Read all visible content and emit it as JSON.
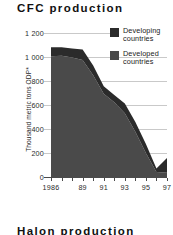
{
  "chart_data": {
    "type": "area",
    "stacked": true,
    "title": "CFC production",
    "xlabel": "",
    "ylabel": "Thousand metric tons ODP*",
    "ylim": [
      0,
      1200
    ],
    "yticks": [
      "0",
      "200",
      "400",
      "600",
      "800",
      "1 000",
      "1 200"
    ],
    "ytick_values": [
      0,
      200,
      400,
      600,
      800,
      1000,
      1200
    ],
    "grid": true,
    "legend_position": "top-right",
    "x": [
      1986,
      1987,
      1988,
      1989,
      1990,
      1991,
      1992,
      1993,
      1994,
      1995,
      1996,
      1997
    ],
    "xtick_labels": [
      "1986",
      "89",
      "91",
      "93",
      "95",
      "97"
    ],
    "xtick_values": [
      1986,
      1989,
      1991,
      1993,
      1995,
      1997
    ],
    "series": [
      {
        "name": "Developed countries",
        "color": "#4a4a4a",
        "values": [
          985,
          990,
          975,
          955,
          830,
          680,
          610,
          520,
          370,
          195,
          40,
          35
        ]
      },
      {
        "name": "Developing countries",
        "color": "#2b2b2b",
        "values": [
          75,
          70,
          75,
          85,
          80,
          60,
          60,
          80,
          80,
          75,
          30,
          120
        ]
      }
    ],
    "totals": [
      1060,
      1060,
      1050,
      1040,
      910,
      740,
      670,
      600,
      450,
      270,
      70,
      155
    ]
  },
  "legend": {
    "entries": [
      {
        "label_line1": "Developing",
        "label_line2": "countries",
        "color": "#2b2b2b"
      },
      {
        "label_line1": "Developed",
        "label_line2": "countries",
        "color": "#4a4a4a"
      }
    ]
  },
  "next_section": {
    "title": "Halon production"
  },
  "colors": {
    "developing": "#2b2b2b",
    "developed": "#4a4a4a",
    "grid": "#c9c9c9",
    "axis": "#4a4a4a",
    "text": "#1a1a1a",
    "background": "#ffffff"
  }
}
